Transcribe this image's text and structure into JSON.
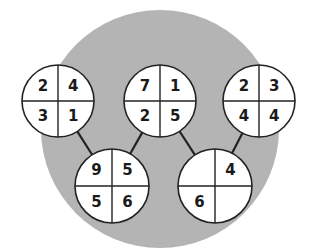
{
  "background_circle": {
    "cx": 160,
    "cy": 129,
    "r": 119,
    "color": "#b4b4b4"
  },
  "circle_style": {
    "fill": "#ffffff",
    "stroke": "#222222"
  },
  "circles": [
    {
      "id": "top-left",
      "cx": 58,
      "cy": 101,
      "r": 36,
      "values": [
        "2",
        "4",
        "3",
        "1"
      ]
    },
    {
      "id": "top-middle",
      "cx": 160,
      "cy": 101,
      "r": 36,
      "values": [
        "7",
        "1",
        "2",
        "5"
      ]
    },
    {
      "id": "top-right",
      "cx": 259,
      "cy": 101,
      "r": 36,
      "values": [
        "2",
        "3",
        "4",
        "4"
      ]
    },
    {
      "id": "bottom-left",
      "cx": 112,
      "cy": 186,
      "r": 37,
      "values": [
        "9",
        "5",
        "5",
        "6"
      ]
    },
    {
      "id": "bottom-right",
      "cx": 215,
      "cy": 186,
      "r": 37,
      "values": [
        "",
        "4",
        "6",
        ""
      ]
    }
  ],
  "connectors": [
    {
      "from": "top-left",
      "to": "bottom-left"
    },
    {
      "from": "top-middle",
      "to": "bottom-left"
    },
    {
      "from": "top-middle",
      "to": "bottom-right"
    },
    {
      "from": "top-right",
      "to": "bottom-right"
    }
  ],
  "quadrant_order": [
    "top-left",
    "top-right",
    "bottom-left",
    "bottom-right"
  ]
}
